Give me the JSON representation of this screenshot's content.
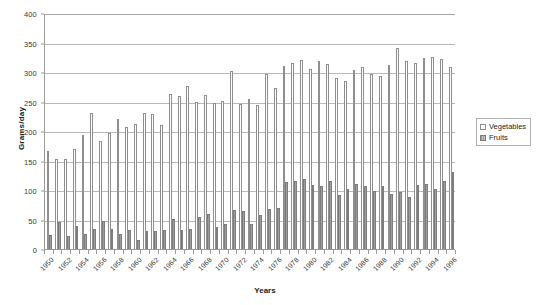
{
  "chart_data": {
    "type": "bar",
    "title": "",
    "xlabel": "Years",
    "ylabel": "Grams/day",
    "ylim": [
      0,
      400
    ],
    "yticks": [
      0,
      50,
      100,
      150,
      200,
      250,
      300,
      350,
      400
    ],
    "grid": true,
    "legend_position": "right",
    "categories": [
      "1950",
      "1951",
      "1952",
      "1953",
      "1954",
      "1955",
      "1956",
      "1957",
      "1958",
      "1959",
      "1960",
      "1961",
      "1962",
      "1963",
      "1964",
      "1965",
      "1966",
      "1967",
      "1968",
      "1969",
      "1970",
      "1971",
      "1972",
      "1973",
      "1974",
      "1975",
      "1976",
      "1977",
      "1978",
      "1979",
      "1980",
      "1981",
      "1982",
      "1983",
      "1984",
      "1985",
      "1986",
      "1987",
      "1988",
      "1989",
      "1990",
      "1991",
      "1992",
      "1993",
      "1994",
      "1995",
      "1996"
    ],
    "tick_labels": [
      "1950",
      "1952",
      "1954",
      "1956",
      "1958",
      "1960",
      "1962",
      "1964",
      "1966",
      "1968",
      "1970",
      "1972",
      "1974",
      "1976",
      "1978",
      "1980",
      "1982",
      "1984",
      "1986",
      "1988",
      "1990",
      "1992",
      "1994",
      "1996"
    ],
    "series": [
      {
        "name": "Vegetables",
        "color": "#ffffff",
        "edge_color": "#8f8f8f",
        "values": [
          166,
          152,
          153,
          170,
          193,
          231,
          183,
          196,
          220,
          207,
          212,
          230,
          228,
          211,
          262,
          259,
          276,
          249,
          261,
          247,
          251,
          301,
          246,
          254,
          244,
          297,
          273,
          310,
          315,
          320,
          305,
          318,
          314,
          290,
          285,
          303,
          309,
          297,
          294,
          312,
          340,
          318,
          316,
          323,
          325,
          322,
          308
        ]
      },
      {
        "name": "Fruits",
        "color": "#a8a8a8",
        "edge_color": "#7d7d7d",
        "values": [
          23,
          46,
          22,
          39,
          26,
          34,
          48,
          34,
          25,
          32,
          16,
          31,
          30,
          33,
          51,
          32,
          34,
          54,
          60,
          38,
          42,
          66,
          64,
          43,
          57,
          67,
          70,
          113,
          116,
          119,
          108,
          106,
          115,
          92,
          102,
          110,
          107,
          98,
          107,
          93,
          96,
          88,
          108,
          111,
          101,
          116,
          130
        ]
      }
    ]
  },
  "legend": {
    "items": [
      {
        "label": "Vegetables",
        "swatch": "veg"
      },
      {
        "label": "Fruits",
        "swatch": "fruit"
      }
    ]
  },
  "axes": {
    "y_title": "Grams/day",
    "x_title": "Years"
  }
}
